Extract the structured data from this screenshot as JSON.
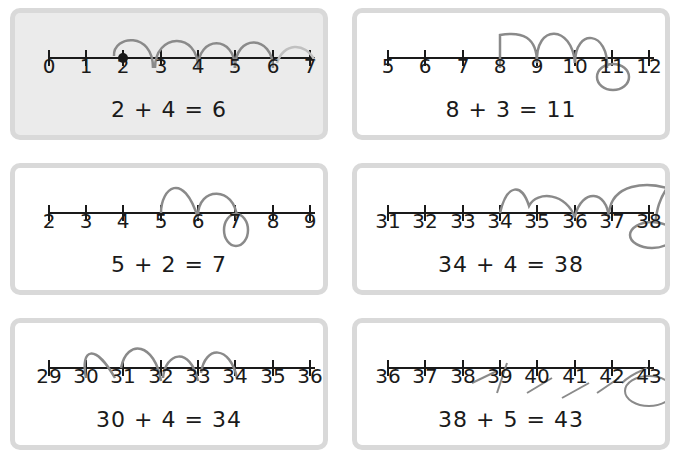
{
  "worksheet": {
    "problems": [
      {
        "id": "p1",
        "shaded": true,
        "example": true,
        "ticks": [
          "0",
          "1",
          "2",
          "3",
          "4",
          "5",
          "6",
          "7"
        ],
        "start_marker": "2",
        "equation": "2 + 4 = 6",
        "handwritten_jumps_between": [
          [
            "2",
            "3"
          ],
          [
            "3",
            "4"
          ],
          [
            "4",
            "5"
          ],
          [
            "5",
            "6"
          ],
          [
            "6",
            "7"
          ]
        ],
        "circled": null
      },
      {
        "id": "p2",
        "shaded": false,
        "ticks": [
          "5",
          "6",
          "7",
          "8",
          "9",
          "10",
          "11",
          "12"
        ],
        "equation": "8 + 3 = 11",
        "handwritten_jumps_between": [
          [
            "8",
            "9"
          ],
          [
            "9",
            "10"
          ],
          [
            "10",
            "11"
          ]
        ],
        "circled": "11"
      },
      {
        "id": "p3",
        "shaded": false,
        "ticks": [
          "2",
          "3",
          "4",
          "5",
          "6",
          "7",
          "8",
          "9"
        ],
        "equation": "5 + 2 = 7",
        "handwritten_jumps_between": [
          [
            "5",
            "6"
          ],
          [
            "6",
            "7"
          ]
        ],
        "circled": "7"
      },
      {
        "id": "p4",
        "shaded": false,
        "ticks": [
          "31",
          "32",
          "33",
          "34",
          "35",
          "36",
          "37",
          "38"
        ],
        "equation": "34 + 4 = 38",
        "handwritten_jumps_between": [
          [
            "34",
            "35"
          ],
          [
            "35",
            "36"
          ],
          [
            "36",
            "37"
          ],
          [
            "37",
            "38"
          ]
        ],
        "circled": "38"
      },
      {
        "id": "p5",
        "shaded": false,
        "ticks": [
          "29",
          "30",
          "31",
          "32",
          "33",
          "34",
          "35",
          "36"
        ],
        "equation": "30 + 4 = 34",
        "handwritten_jumps_between": [
          [
            "30",
            "31"
          ],
          [
            "31",
            "32"
          ],
          [
            "32",
            "33"
          ],
          [
            "33",
            "34"
          ]
        ],
        "circled": null
      },
      {
        "id": "p6",
        "shaded": false,
        "ticks": [
          "36",
          "37",
          "38",
          "39",
          "40",
          "41",
          "42",
          "43"
        ],
        "equation": "38 + 5 = 43",
        "handwritten_jumps_between": [
          [
            "38",
            "39"
          ],
          [
            "39",
            "40"
          ],
          [
            "40",
            "41"
          ],
          [
            "41",
            "42"
          ],
          [
            "42",
            "43"
          ]
        ],
        "circled": "43"
      }
    ]
  },
  "colors": {
    "box_border": "#d9d9d9",
    "box_shaded_bg": "#ebebeb",
    "ink": "#1a1a1a",
    "pencil": "#8a8a8a"
  }
}
